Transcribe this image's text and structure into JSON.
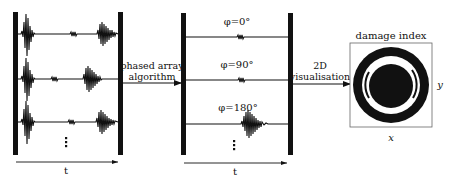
{
  "diagram": {
    "left_panel": {
      "rows": 3,
      "ellipsis": "⋮",
      "time_axis_label": "t"
    },
    "arrow_1": {
      "line1": "phased array",
      "line2": "algorithm"
    },
    "middle_panel": {
      "rows": [
        {
          "label": "φ=0°"
        },
        {
          "label": "φ=90°"
        },
        {
          "label": "φ=180°"
        }
      ],
      "ellipsis": "⋮",
      "time_axis_label": "t"
    },
    "arrow_2": {
      "line1": "2D",
      "line2": "visualisation"
    },
    "output_image": {
      "title": "damage index",
      "x_label": "x",
      "y_label": "y"
    },
    "colors": {
      "ink": "#111111",
      "background": "#ffffff",
      "frame": "#666666"
    }
  }
}
